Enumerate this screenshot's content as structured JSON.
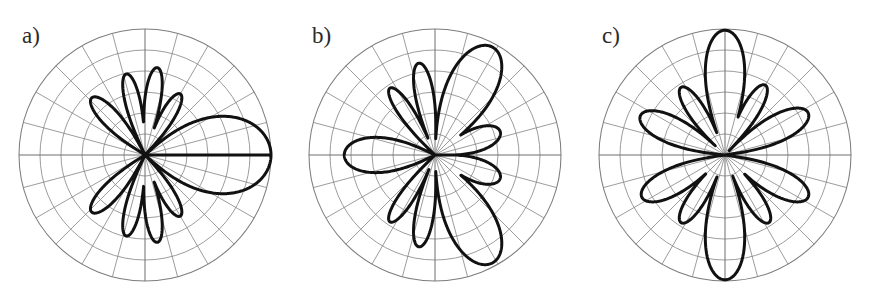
{
  "figure": {
    "background": "#ffffff",
    "width": 870,
    "height": 302,
    "curve_color": "#111111",
    "grid_color": "#8a8a8a"
  },
  "panels": [
    {
      "label": "a)"
    },
    {
      "label": "b)"
    },
    {
      "label": "c)"
    }
  ],
  "chart_data": [
    {
      "type": "line",
      "subtype": "polar",
      "title": "a)",
      "xlabel": "",
      "ylabel": "",
      "grid": true,
      "legend": false,
      "axis_ranges": {
        "theta_deg": [
          0,
          360
        ],
        "r": [
          0,
          1
        ]
      },
      "grid_rings_r": [
        0.1667,
        0.3333,
        0.5,
        0.6667,
        0.8333,
        1.0
      ],
      "grid_spokes_deg": [
        0,
        15,
        30,
        45,
        60,
        75,
        90,
        105,
        120,
        135,
        150,
        165,
        180,
        195,
        210,
        225,
        240,
        255,
        270,
        285,
        300,
        315,
        330,
        345
      ],
      "lobes": [
        {
          "center_deg": 0,
          "peak_r": 1.0,
          "half_width_deg": 42
        },
        {
          "center_deg": 60,
          "peak_r": 0.56,
          "half_width_deg": 13
        },
        {
          "center_deg": 82,
          "peak_r": 0.7,
          "half_width_deg": 12
        },
        {
          "center_deg": 103,
          "peak_r": 0.66,
          "half_width_deg": 12
        },
        {
          "center_deg": 133,
          "peak_r": 0.62,
          "half_width_deg": 15
        },
        {
          "center_deg": 227,
          "peak_r": 0.62,
          "half_width_deg": 15
        },
        {
          "center_deg": 257,
          "peak_r": 0.66,
          "half_width_deg": 12
        },
        {
          "center_deg": 278,
          "peak_r": 0.7,
          "half_width_deg": 12
        },
        {
          "center_deg": 300,
          "peak_r": 0.56,
          "half_width_deg": 13
        }
      ]
    },
    {
      "type": "line",
      "subtype": "polar",
      "title": "b)",
      "xlabel": "",
      "ylabel": "",
      "grid": true,
      "legend": false,
      "axis_ranges": {
        "theta_deg": [
          0,
          360
        ],
        "r": [
          0,
          1
        ]
      },
      "grid_rings_r": [
        0.1667,
        0.3333,
        0.5,
        0.6667,
        0.8333,
        1.0
      ],
      "grid_spokes_deg": [
        0,
        15,
        30,
        45,
        60,
        75,
        90,
        105,
        120,
        135,
        150,
        165,
        180,
        195,
        210,
        225,
        240,
        255,
        270,
        285,
        300,
        315,
        330,
        345
      ],
      "lobes": [
        {
          "center_deg": 20,
          "peak_r": 0.55,
          "half_width_deg": 22
        },
        {
          "center_deg": 62,
          "peak_r": 0.97,
          "half_width_deg": 26
        },
        {
          "center_deg": 100,
          "peak_r": 0.74,
          "half_width_deg": 13
        },
        {
          "center_deg": 124,
          "peak_r": 0.64,
          "half_width_deg": 12
        },
        {
          "center_deg": 180,
          "peak_r": 0.72,
          "half_width_deg": 26
        },
        {
          "center_deg": 236,
          "peak_r": 0.64,
          "half_width_deg": 12
        },
        {
          "center_deg": 260,
          "peak_r": 0.74,
          "half_width_deg": 13
        },
        {
          "center_deg": 298,
          "peak_r": 0.97,
          "half_width_deg": 26
        },
        {
          "center_deg": 340,
          "peak_r": 0.55,
          "half_width_deg": 22
        }
      ]
    },
    {
      "type": "line",
      "subtype": "polar",
      "title": "c)",
      "xlabel": "",
      "ylabel": "",
      "grid": true,
      "legend": false,
      "axis_ranges": {
        "theta_deg": [
          0,
          360
        ],
        "r": [
          0,
          1
        ]
      },
      "grid_rings_r": [
        0.1667,
        0.3333,
        0.5,
        0.6667,
        0.8333,
        1.0
      ],
      "grid_spokes_deg": [
        0,
        15,
        30,
        45,
        60,
        75,
        90,
        105,
        120,
        135,
        150,
        165,
        180,
        195,
        210,
        225,
        240,
        255,
        270,
        285,
        300,
        315,
        330,
        345
      ],
      "lobes": [
        {
          "center_deg": 27,
          "peak_r": 0.74,
          "half_width_deg": 19
        },
        {
          "center_deg": 60,
          "peak_r": 0.64,
          "half_width_deg": 14
        },
        {
          "center_deg": 90,
          "peak_r": 0.99,
          "half_width_deg": 21
        },
        {
          "center_deg": 123,
          "peak_r": 0.64,
          "half_width_deg": 14
        },
        {
          "center_deg": 155,
          "peak_r": 0.74,
          "half_width_deg": 19
        },
        {
          "center_deg": 207,
          "peak_r": 0.74,
          "half_width_deg": 19
        },
        {
          "center_deg": 237,
          "peak_r": 0.64,
          "half_width_deg": 14
        },
        {
          "center_deg": 270,
          "peak_r": 0.99,
          "half_width_deg": 21
        },
        {
          "center_deg": 303,
          "peak_r": 0.64,
          "half_width_deg": 14
        },
        {
          "center_deg": 333,
          "peak_r": 0.74,
          "half_width_deg": 19
        }
      ]
    }
  ]
}
